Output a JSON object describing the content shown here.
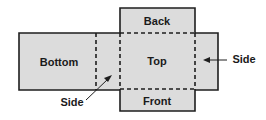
{
  "diagram": {
    "type": "box-net",
    "colors": {
      "fill": "#dcdcdc",
      "stroke": "#1e1e1e",
      "background": "#ffffff"
    },
    "faces": {
      "back": "Back",
      "top": "Top",
      "front": "Front",
      "bottom": "Bottom"
    },
    "callouts": {
      "side_left": "Side",
      "side_right": "Side"
    }
  }
}
